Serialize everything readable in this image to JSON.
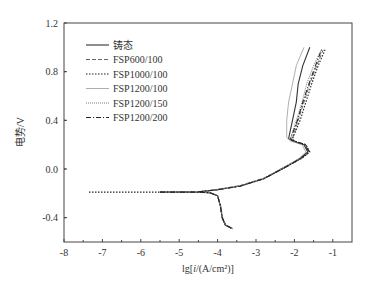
{
  "chart_data": {
    "type": "line",
    "title": "",
    "xlabel": "lg[i/(A/cm²)]",
    "ylabel": "电势/V",
    "xlim": [
      -8,
      -0.5
    ],
    "ylim": [
      -0.6,
      1.2
    ],
    "x_ticks": [
      -8,
      -7,
      -6,
      -5,
      -4,
      -3,
      -2,
      -1
    ],
    "x_tick_labels": [
      "-8",
      "-7",
      "-6",
      "-5",
      "-4",
      "-3",
      "-2",
      "-1"
    ],
    "y_ticks": [
      1.2,
      0.8,
      0.4,
      0.0,
      -0.4
    ],
    "y_tick_labels": [
      "1.2",
      "0.8",
      "0.4",
      "0.0",
      "-0.4"
    ],
    "grid": false,
    "legend_position": "upper left",
    "series": [
      {
        "name": "铸态",
        "style": "solid",
        "color": "#333333",
        "points": [
          [
            -5.5,
            -0.19
          ],
          [
            -4.6,
            -0.19
          ],
          [
            -4.2,
            -0.195
          ],
          [
            -4.0,
            -0.22
          ],
          [
            -3.93,
            -0.3
          ],
          [
            -3.88,
            -0.4
          ],
          [
            -3.8,
            -0.46
          ],
          [
            -3.62,
            -0.49
          ],
          [
            -4.5,
            -0.188
          ],
          [
            -4.0,
            -0.17
          ],
          [
            -3.4,
            -0.14
          ],
          [
            -2.8,
            -0.08
          ],
          [
            -2.2,
            0.02
          ],
          [
            -1.85,
            0.09
          ],
          [
            -1.65,
            0.14
          ],
          [
            -1.75,
            0.2
          ],
          [
            -2.05,
            0.23
          ],
          [
            -2.15,
            0.25
          ],
          [
            -2.05,
            0.4
          ],
          [
            -1.95,
            0.55
          ],
          [
            -1.9,
            0.7
          ],
          [
            -1.78,
            0.85
          ],
          [
            -1.6,
            1.0
          ]
        ]
      },
      {
        "name": "FSP600/100",
        "style": "dashed",
        "color": "#666666",
        "points": [
          [
            -5.5,
            -0.19
          ],
          [
            -4.6,
            -0.19
          ],
          [
            -4.2,
            -0.195
          ],
          [
            -4.0,
            -0.22
          ],
          [
            -3.92,
            -0.3
          ],
          [
            -3.87,
            -0.4
          ],
          [
            -3.78,
            -0.46
          ],
          [
            -3.6,
            -0.49
          ],
          [
            -4.5,
            -0.188
          ],
          [
            -4.0,
            -0.168
          ],
          [
            -3.4,
            -0.135
          ],
          [
            -2.8,
            -0.075
          ],
          [
            -2.2,
            0.025
          ],
          [
            -1.8,
            0.09
          ],
          [
            -1.6,
            0.14
          ],
          [
            -1.7,
            0.2
          ],
          [
            -2.0,
            0.23
          ],
          [
            -2.05,
            0.25
          ],
          [
            -1.9,
            0.4
          ],
          [
            -1.75,
            0.55
          ],
          [
            -1.6,
            0.7
          ],
          [
            -1.42,
            0.85
          ],
          [
            -1.25,
            0.98
          ]
        ]
      },
      {
        "name": "FSP1000/100",
        "style": "dotted",
        "color": "#222222",
        "points": [
          [
            -7.35,
            -0.19
          ],
          [
            -6.0,
            -0.19
          ],
          [
            -4.6,
            -0.19
          ],
          [
            -4.2,
            -0.195
          ],
          [
            -4.0,
            -0.22
          ],
          [
            -3.93,
            -0.3
          ],
          [
            -3.88,
            -0.4
          ],
          [
            -3.8,
            -0.46
          ],
          [
            -3.62,
            -0.49
          ],
          [
            -4.5,
            -0.188
          ],
          [
            -4.0,
            -0.17
          ],
          [
            -3.4,
            -0.14
          ],
          [
            -2.8,
            -0.08
          ],
          [
            -2.2,
            0.02
          ],
          [
            -1.8,
            0.09
          ],
          [
            -1.6,
            0.14
          ],
          [
            -1.7,
            0.2
          ],
          [
            -2.0,
            0.23
          ],
          [
            -2.05,
            0.25
          ],
          [
            -1.85,
            0.4
          ],
          [
            -1.7,
            0.55
          ],
          [
            -1.55,
            0.7
          ],
          [
            -1.38,
            0.85
          ],
          [
            -1.2,
            0.98
          ]
        ]
      },
      {
        "name": "FSP1200/100",
        "style": "solid-light",
        "color": "#999999",
        "points": [
          [
            -5.5,
            -0.19
          ],
          [
            -4.6,
            -0.19
          ],
          [
            -4.2,
            -0.195
          ],
          [
            -4.0,
            -0.22
          ],
          [
            -3.93,
            -0.3
          ],
          [
            -3.88,
            -0.4
          ],
          [
            -3.8,
            -0.46
          ],
          [
            -3.62,
            -0.49
          ],
          [
            -4.5,
            -0.188
          ],
          [
            -4.0,
            -0.17
          ],
          [
            -3.4,
            -0.14
          ],
          [
            -2.8,
            -0.08
          ],
          [
            -2.3,
            0.01
          ],
          [
            -1.9,
            0.08
          ],
          [
            -1.7,
            0.14
          ],
          [
            -1.8,
            0.2
          ],
          [
            -2.1,
            0.23
          ],
          [
            -2.2,
            0.26
          ],
          [
            -2.2,
            0.4
          ],
          [
            -2.15,
            0.55
          ],
          [
            -2.05,
            0.7
          ],
          [
            -1.95,
            0.85
          ],
          [
            -1.75,
            1.0
          ]
        ]
      },
      {
        "name": "FSP1200/150",
        "style": "fine-dotted",
        "color": "#555555",
        "points": [
          [
            -5.5,
            -0.19
          ],
          [
            -4.6,
            -0.19
          ],
          [
            -4.2,
            -0.195
          ],
          [
            -4.0,
            -0.22
          ],
          [
            -3.93,
            -0.3
          ],
          [
            -3.88,
            -0.4
          ],
          [
            -3.8,
            -0.46
          ],
          [
            -3.62,
            -0.49
          ],
          [
            -4.5,
            -0.188
          ],
          [
            -4.0,
            -0.17
          ],
          [
            -3.4,
            -0.14
          ],
          [
            -2.8,
            -0.08
          ],
          [
            -2.25,
            0.02
          ],
          [
            -1.85,
            0.09
          ],
          [
            -1.65,
            0.14
          ],
          [
            -1.75,
            0.2
          ],
          [
            -2.05,
            0.23
          ],
          [
            -2.1,
            0.25
          ],
          [
            -1.95,
            0.4
          ],
          [
            -1.8,
            0.55
          ],
          [
            -1.68,
            0.7
          ],
          [
            -1.5,
            0.85
          ],
          [
            -1.3,
            0.98
          ]
        ]
      },
      {
        "name": "FSP1200/200",
        "style": "dash-dot",
        "color": "#222222",
        "points": [
          [
            -5.5,
            -0.19
          ],
          [
            -4.6,
            -0.19
          ],
          [
            -4.2,
            -0.195
          ],
          [
            -4.0,
            -0.22
          ],
          [
            -3.93,
            -0.3
          ],
          [
            -3.88,
            -0.4
          ],
          [
            -3.8,
            -0.46
          ],
          [
            -3.62,
            -0.49
          ],
          [
            -4.5,
            -0.188
          ],
          [
            -4.0,
            -0.17
          ],
          [
            -3.4,
            -0.14
          ],
          [
            -2.8,
            -0.08
          ],
          [
            -2.2,
            0.02
          ],
          [
            -1.82,
            0.09
          ],
          [
            -1.62,
            0.14
          ],
          [
            -1.72,
            0.2
          ],
          [
            -2.02,
            0.23
          ],
          [
            -2.1,
            0.25
          ],
          [
            -1.92,
            0.4
          ],
          [
            -1.78,
            0.55
          ],
          [
            -1.62,
            0.7
          ],
          [
            -1.45,
            0.85
          ],
          [
            -1.28,
            0.99
          ]
        ]
      }
    ]
  },
  "axes": {
    "y_label": "电势/V",
    "x_label_prefix": "lg[",
    "x_label_italic": "i",
    "x_label_suffix": "/(A/cm²)]"
  },
  "legend": {
    "items": [
      "铸态",
      "FSP600/100",
      "FSP1000/100",
      "FSP1200/100",
      "FSP1200/150",
      "FSP1200/200"
    ]
  }
}
